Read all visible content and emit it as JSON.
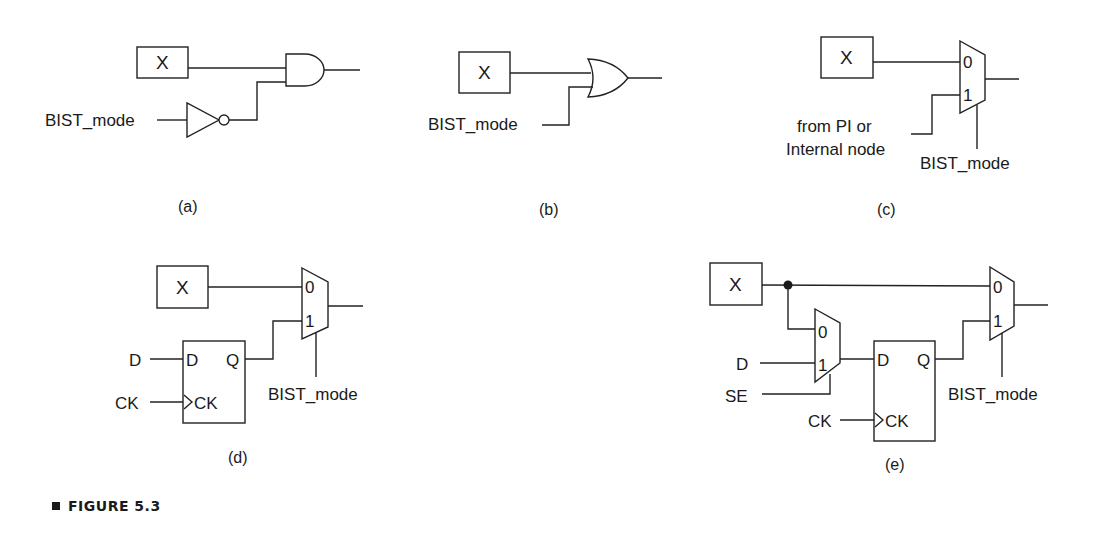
{
  "figure": {
    "caption": "FIGURE 5.3"
  },
  "panels": {
    "a": {
      "sublabel": "(a)",
      "block_label": "X",
      "input_label": "BIST_mode",
      "gate": "AND with inverted BIST_mode"
    },
    "b": {
      "sublabel": "(b)",
      "block_label": "X",
      "input_label": "BIST_mode",
      "gate": "OR"
    },
    "c": {
      "sublabel": "(c)",
      "block_label": "X",
      "mux_in0": "0",
      "mux_in1": "1",
      "alt_input_line1": "from PI or",
      "alt_input_line2": "Internal node",
      "select_label": "BIST_mode"
    },
    "d": {
      "sublabel": "(d)",
      "block_label": "X",
      "mux_in0": "0",
      "mux_in1": "1",
      "ff_in_label": "D",
      "ff_ck_label": "CK",
      "ff_pin_d": "D",
      "ff_pin_q": "Q",
      "ff_pin_ck": "CK",
      "select_label": "BIST_mode"
    },
    "e": {
      "sublabel": "(e)",
      "block_label": "X",
      "scan_mux_in0": "0",
      "scan_mux_in1": "1",
      "d_label": "D",
      "se_label": "SE",
      "ck_label": "CK",
      "ff_pin_d": "D",
      "ff_pin_q": "Q",
      "ff_pin_ck": "CK",
      "mux_in0": "0",
      "mux_in1": "1",
      "select_label": "BIST_mode"
    }
  }
}
